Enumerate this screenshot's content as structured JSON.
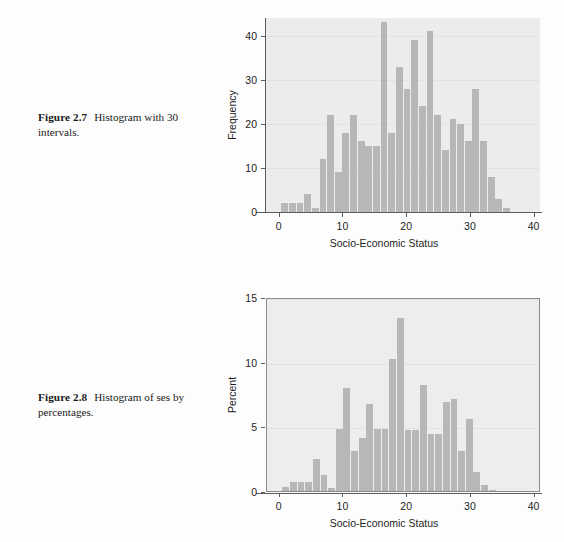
{
  "page": {
    "background": "#fdfdfd",
    "bar_color": "#b7b7b7",
    "plot_background": "#ececec",
    "axis_color": "#5c5c5c"
  },
  "figures": [
    {
      "id": "figure-1",
      "caption_number": "Figure 2.7",
      "caption_text": "Histogram with 30 intervals."
    },
    {
      "id": "figure-2",
      "caption_number": "Figure 2.8",
      "caption_text": "Histogram of ses by percentages."
    }
  ],
  "chart_data": [
    {
      "type": "bar",
      "title": "",
      "xlabel": "Socio-Economic Status",
      "ylabel": "Frequency",
      "xlim": [
        -2,
        41
      ],
      "ylim": [
        0,
        44
      ],
      "xticks": [
        0,
        10,
        20,
        30,
        40
      ],
      "xticklabels": [
        "0",
        "10",
        "20",
        "30",
        "40"
      ],
      "yticks": [
        0,
        10,
        20,
        30,
        40
      ],
      "yticklabels": [
        "0",
        "10",
        "20",
        "30",
        "40"
      ],
      "grid": true,
      "grid_axis": "y",
      "legend": "none",
      "frame": false,
      "bin_width": 1.16,
      "bin_starts": [
        0.4,
        1.6,
        2.8,
        4.0,
        5.2,
        6.4,
        7.6,
        8.8,
        10.0,
        11.2,
        12.4,
        13.6,
        14.8,
        16.0,
        17.2,
        18.4,
        19.6,
        20.8,
        22.0,
        23.2,
        24.4,
        25.6,
        26.8,
        28.0,
        29.2,
        30.4,
        31.6,
        32.8,
        34.0,
        35.2
      ],
      "categories": [
        "0.4",
        "1.6",
        "2.8",
        "4.0",
        "5.2",
        "6.4",
        "7.6",
        "8.8",
        "10.0",
        "11.2",
        "12.4",
        "13.6",
        "14.8",
        "16.0",
        "17.2",
        "18.4",
        "19.6",
        "20.8",
        "22.0",
        "23.2",
        "24.4",
        "25.6",
        "26.8",
        "28.0",
        "29.2",
        "30.4",
        "31.6",
        "32.8",
        "34.0",
        "35.2"
      ],
      "values": [
        2,
        2,
        2,
        4,
        1,
        12,
        22,
        9,
        18,
        22,
        16,
        15,
        15,
        43,
        18,
        33,
        28,
        39,
        24,
        41,
        22,
        14,
        21,
        20,
        16,
        28,
        16,
        8,
        3,
        1
      ]
    },
    {
      "type": "bar",
      "title": "",
      "xlabel": "Socio-Economic Status",
      "ylabel": "Percent",
      "xlim": [
        -2,
        41
      ],
      "ylim": [
        0,
        15
      ],
      "xticks": [
        0,
        10,
        20,
        30,
        40
      ],
      "xticklabels": [
        "0",
        "10",
        "20",
        "30",
        "40"
      ],
      "yticks": [
        0,
        5,
        10,
        15
      ],
      "yticklabels": [
        "0",
        "5",
        "10",
        "15"
      ],
      "grid": true,
      "grid_axis": "y",
      "legend": "none",
      "frame": true,
      "bin_width": 1.16,
      "bin_starts": [
        0.4,
        1.6,
        2.8,
        4.0,
        5.2,
        6.4,
        7.6,
        8.8,
        10.0,
        11.2,
        12.4,
        13.6,
        14.8,
        16.0,
        17.2,
        18.4,
        19.6,
        20.8,
        22.0,
        23.2,
        24.4,
        25.6,
        26.8,
        28.0,
        29.2,
        30.4,
        31.6,
        32.8,
        34.0,
        35.2
      ],
      "categories": [
        "0.4",
        "1.6",
        "2.8",
        "4.0",
        "5.2",
        "6.4",
        "7.6",
        "8.8",
        "10.0",
        "11.2",
        "12.4",
        "13.6",
        "14.8",
        "16.0",
        "17.2",
        "18.4",
        "19.6",
        "20.8",
        "22.0",
        "23.2",
        "24.4",
        "25.6",
        "26.8",
        "28.0",
        "29.2",
        "30.4",
        "31.6",
        "32.8",
        "34.0",
        "35.2"
      ],
      "values": [
        0.3,
        0.7,
        0.7,
        0.7,
        2.5,
        1.2,
        0.2,
        4.8,
        8.0,
        3.1,
        4.1,
        6.7,
        4.8,
        4.8,
        10.2,
        13.4,
        4.7,
        4.7,
        8.2,
        4.4,
        4.4,
        6.9,
        7.1,
        3.1,
        5.6,
        1.5,
        0.5,
        0.1,
        0.0,
        0.0
      ]
    }
  ]
}
